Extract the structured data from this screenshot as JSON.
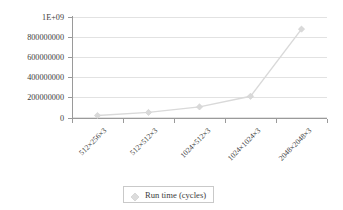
{
  "chart_data": {
    "type": "line",
    "title": "",
    "xlabel": "",
    "ylabel": "",
    "categories": [
      "512×256×3",
      "512×512×3",
      "1024×512×3",
      "1024×1024×3",
      "2048×2048×3"
    ],
    "series": [
      {
        "name": "Run time (cycles)",
        "values": [
          25000000,
          55000000,
          110000000,
          215000000,
          880000000
        ],
        "color": "#d9d9d9",
        "marker": "diamond"
      }
    ],
    "ylim": [
      0,
      1000000000
    ],
    "yticks": [
      0,
      200000000,
      400000000,
      600000000,
      800000000,
      1000000000
    ],
    "ytick_labels": [
      "0",
      "200000000",
      "400000000",
      "600000000",
      "800000000",
      "1E+09"
    ],
    "grid": "horizontal",
    "legend_position": "bottom-center"
  },
  "legend": {
    "entries": [
      {
        "label": "Run time (cycles)",
        "marker_icon": "diamond-marker-icon"
      }
    ]
  },
  "colors": {
    "series": "#d9d9d9",
    "gridline": "#e2e2e2",
    "axis": "#9a9a9a",
    "text": "#3d3d3d",
    "background": "#ffffff",
    "legend_border": "#c9c9c9"
  }
}
